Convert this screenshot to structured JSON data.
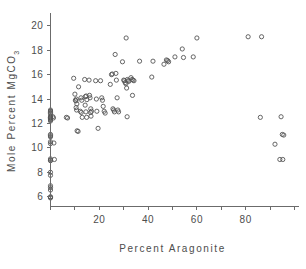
{
  "chart_data": {
    "type": "scatter",
    "title": "",
    "xlabel": "Percent Aragonite",
    "ylabel_main": "Mole Percent MgCO",
    "ylabel_sub": "3",
    "ylabel_full": "Mole Percent MgCO3",
    "xlim": [
      0,
      100
    ],
    "ylim": [
      5.2,
      20.8
    ],
    "grid": false,
    "legend": null,
    "marker": "open-circle",
    "marker_color": "#555555",
    "xticks_major": [
      20,
      40,
      60,
      80
    ],
    "xticks_major_labels": [
      "20",
      "40",
      "60",
      "80"
    ],
    "xticks_minor": [
      0,
      10,
      30,
      50,
      70,
      90,
      100
    ],
    "yticks_major": [
      6,
      8,
      10,
      12,
      14,
      16,
      18,
      20
    ],
    "yticks_major_labels": [
      "6",
      "8",
      "10",
      "12",
      "14",
      "16",
      "18",
      "20"
    ],
    "points": [
      [
        0,
        13.1
      ],
      [
        0,
        13.0
      ],
      [
        0,
        12.9
      ],
      [
        0,
        12.8
      ],
      [
        0,
        12.6
      ],
      [
        0,
        12.5
      ],
      [
        0,
        12.5
      ],
      [
        0,
        12.45
      ],
      [
        0,
        12.4
      ],
      [
        0,
        12.3
      ],
      [
        0,
        12.2
      ],
      [
        0,
        11.1
      ],
      [
        0,
        11.0
      ],
      [
        0,
        10.9
      ],
      [
        0,
        10.5
      ],
      [
        0,
        10.35
      ],
      [
        0,
        9.1
      ],
      [
        0,
        9.0
      ],
      [
        0,
        8.95
      ],
      [
        0,
        8.0
      ],
      [
        0,
        7.75
      ],
      [
        0,
        6.9
      ],
      [
        0,
        6.75
      ],
      [
        0,
        6.55
      ],
      [
        0,
        6.0
      ],
      [
        0,
        5.95
      ],
      [
        0,
        5.9
      ],
      [
        1.0,
        12.55
      ],
      [
        1.2,
        12.45
      ],
      [
        1.4,
        10.4
      ],
      [
        1.6,
        9.05
      ],
      [
        6.5,
        12.5
      ],
      [
        7.0,
        12.45
      ],
      [
        9.5,
        15.7
      ],
      [
        10.0,
        14.4
      ],
      [
        10.2,
        13.9
      ],
      [
        10.4,
        13.85
      ],
      [
        10.6,
        14.0
      ],
      [
        10.8,
        13.6
      ],
      [
        10.5,
        13.3
      ],
      [
        10.7,
        13.1
      ],
      [
        10.9,
        11.4
      ],
      [
        11.3,
        11.35
      ],
      [
        11.5,
        15.0
      ],
      [
        12.5,
        14.1
      ],
      [
        12.8,
        13.9
      ],
      [
        12.2,
        13.0
      ],
      [
        12.6,
        12.9
      ],
      [
        13.0,
        12.5
      ],
      [
        14.0,
        15.6
      ],
      [
        14.3,
        14.2
      ],
      [
        14.6,
        14.25
      ],
      [
        14.9,
        13.95
      ],
      [
        14.2,
        13.5
      ],
      [
        14.5,
        12.95
      ],
      [
        14.8,
        12.5
      ],
      [
        15.8,
        15.55
      ],
      [
        16.0,
        14.3
      ],
      [
        16.2,
        14.1
      ],
      [
        16.5,
        13.2
      ],
      [
        16.8,
        13.0
      ],
      [
        16.4,
        12.9
      ],
      [
        16.6,
        12.6
      ],
      [
        18.5,
        15.5
      ],
      [
        18.8,
        14.0
      ],
      [
        19.0,
        13.0
      ],
      [
        19.5,
        11.6
      ],
      [
        20.5,
        15.5
      ],
      [
        21.0,
        14.1
      ],
      [
        21.3,
        13.9
      ],
      [
        21.6,
        13.4
      ],
      [
        22.0,
        13.0
      ],
      [
        22.4,
        12.85
      ],
      [
        24.5,
        15.2
      ],
      [
        25.0,
        16.0
      ],
      [
        25.3,
        16.05
      ],
      [
        25.6,
        13.2
      ],
      [
        25.9,
        13.1
      ],
      [
        26.2,
        12.95
      ],
      [
        26.5,
        17.65
      ],
      [
        26.8,
        16.1
      ],
      [
        27.0,
        15.55
      ],
      [
        27.3,
        14.1
      ],
      [
        27.6,
        13.1
      ],
      [
        27.9,
        12.95
      ],
      [
        29.5,
        17.05
      ],
      [
        30.0,
        15.55
      ],
      [
        30.3,
        15.5
      ],
      [
        30.6,
        15.35
      ],
      [
        30.9,
        15.25
      ],
      [
        31.2,
        14.9
      ],
      [
        31.0,
        19.0
      ],
      [
        31.5,
        15.6
      ],
      [
        31.8,
        15.5
      ],
      [
        32.1,
        15.45
      ],
      [
        31.4,
        12.55
      ],
      [
        33.0,
        15.75
      ],
      [
        33.4,
        15.6
      ],
      [
        33.8,
        15.55
      ],
      [
        34.2,
        15.5
      ],
      [
        33.6,
        14.3
      ],
      [
        36.5,
        17.1
      ],
      [
        41.5,
        15.8
      ],
      [
        42.0,
        17.1
      ],
      [
        46.5,
        16.85
      ],
      [
        47.5,
        17.2
      ],
      [
        48.0,
        17.15
      ],
      [
        48.4,
        17.05
      ],
      [
        51.0,
        17.45
      ],
      [
        54.0,
        18.1
      ],
      [
        54.5,
        17.4
      ],
      [
        58.5,
        17.45
      ],
      [
        60.0,
        19.0
      ],
      [
        81.0,
        19.1
      ],
      [
        86.5,
        19.1
      ],
      [
        86.0,
        12.5
      ],
      [
        94.5,
        12.55
      ],
      [
        95.0,
        11.1
      ],
      [
        95.6,
        11.05
      ],
      [
        92.0,
        10.3
      ],
      [
        94.0,
        9.05
      ],
      [
        95.2,
        9.05
      ]
    ]
  }
}
